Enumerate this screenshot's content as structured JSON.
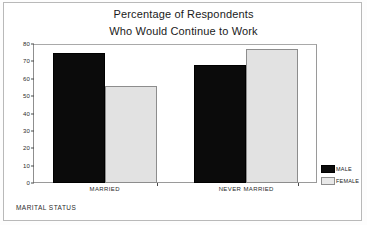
{
  "chart_data": {
    "type": "bar",
    "title": "Percentage of Respondents Who Would Continue to Work",
    "title_lines": [
      "Percentage of Respondents",
      "Who Would Continue to Work"
    ],
    "categories": [
      "MARRIED",
      "NEVER MARRIED"
    ],
    "series": [
      {
        "name": "MALE",
        "values": [
          75,
          68
        ],
        "color": "#0b0b0b"
      },
      {
        "name": "FEMALE",
        "values": [
          56,
          77
        ],
        "color": "#e2e2e2"
      }
    ],
    "xlabel": "MARITAL STATUS",
    "ylabel": "",
    "ylim": [
      0,
      80
    ],
    "yticks": [
      0,
      10,
      20,
      30,
      40,
      50,
      60,
      70,
      80
    ],
    "ytick_labels": [
      "0",
      "10",
      "20",
      "30",
      "40",
      "50",
      "60",
      "70",
      "80"
    ],
    "grid": false,
    "legend_position": "right-bottom",
    "legend_entries": [
      "MALE",
      "FEMALE"
    ]
  },
  "legend": {
    "items": [
      {
        "label": "MALE",
        "swatch": "black-swatch-icon"
      },
      {
        "label": "FEMALE",
        "swatch": "gray-swatch-icon"
      }
    ]
  }
}
